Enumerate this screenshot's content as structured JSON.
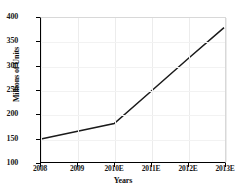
{
  "chart_data": {
    "type": "line",
    "title": "",
    "xlabel": "Years",
    "ylabel": "Millions of Units",
    "categories": [
      "2008",
      "2009",
      "2010E",
      "2011E",
      "2012E",
      "2013E"
    ],
    "x": [
      2008,
      2009,
      2010,
      2011,
      2012,
      2013
    ],
    "values": [
      148,
      164,
      180,
      247,
      314,
      380
    ],
    "series": [
      {
        "name": "Units",
        "values": [
          148,
          164,
          180,
          247,
          314,
          380
        ]
      }
    ],
    "ylim": [
      100,
      400
    ],
    "yticks": [
      "100",
      "150",
      "200",
      "250",
      "300",
      "350",
      "400"
    ],
    "ytick_values": [
      100,
      150,
      200,
      250,
      300,
      350,
      400
    ],
    "xtick_labels": [
      "2008",
      "2009",
      "2010E",
      "2011E",
      "2012E",
      "2013E"
    ],
    "grid": true,
    "legend": "none",
    "line_color": "#1a1a1a",
    "background_color": "#ffffff",
    "grid_color": "#ececec",
    "axis_color": "#000000",
    "annotations": [
      {
        "label": "inflection",
        "x": "2010E",
        "y": 180
      }
    ]
  }
}
